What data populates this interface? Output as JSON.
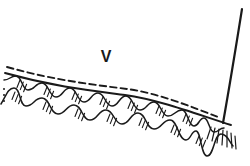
{
  "labels": {
    "velocity": "V"
  },
  "colors": {
    "ink": "#1a1a1a",
    "background": "#ffffff"
  }
}
